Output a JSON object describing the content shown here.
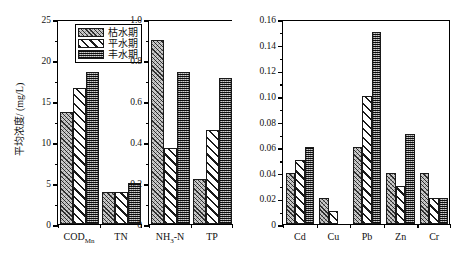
{
  "chart_data": {
    "type": "bar",
    "title": "",
    "xlabel": "",
    "ylabel": "平均浓度/ (mg/L)",
    "grid": false,
    "legend_position": "top-left of panel 1",
    "series_names": [
      "枯水期",
      "平水期",
      "丰水期"
    ],
    "panels": [
      {
        "name": "panel-nutrients-1",
        "categories": [
          "CODMn",
          "TN"
        ],
        "category_labels": [
          "COD<sub>Mn</sub>",
          "TN"
        ],
        "ylim": [
          0,
          25
        ],
        "yticks": [
          0,
          5,
          10,
          15,
          20,
          25
        ],
        "ytick_labels": [
          "0",
          "5",
          "10",
          "15",
          "20",
          "25"
        ],
        "yminor_step": 2.5,
        "series": [
          {
            "name": "枯水期",
            "values": [
              13.7,
              3.9
            ]
          },
          {
            "name": "平水期",
            "values": [
              16.6,
              3.9
            ]
          },
          {
            "name": "丰水期",
            "values": [
              18.5,
              5.0
            ]
          }
        ]
      },
      {
        "name": "panel-nutrients-2",
        "categories": [
          "NH3-N",
          "TP"
        ],
        "category_labels": [
          "NH<sub>3</sub>-N",
          "TP"
        ],
        "ylim": [
          0,
          1.0
        ],
        "yticks": [
          0,
          0.2,
          0.4,
          0.6,
          0.8,
          1.0
        ],
        "ytick_labels": [
          "0",
          "0.2",
          "0.4",
          "0.6",
          "0.8",
          "1.0"
        ],
        "yminor_step": 0.1,
        "series": [
          {
            "name": "枯水期",
            "values": [
              0.9,
              0.22
            ]
          },
          {
            "name": "平水期",
            "values": [
              0.37,
              0.46
            ]
          },
          {
            "name": "丰水期",
            "values": [
              0.74,
              0.71
            ]
          }
        ]
      },
      {
        "name": "panel-metals",
        "categories": [
          "Cd",
          "Cu",
          "Pb",
          "Zn",
          "Cr"
        ],
        "category_labels": [
          "Cd",
          "Cu",
          "Pb",
          "Zn",
          "Cr"
        ],
        "ylim": [
          0,
          0.16
        ],
        "yticks": [
          0,
          0.02,
          0.04,
          0.06,
          0.08,
          0.1,
          0.12,
          0.14,
          0.16
        ],
        "ytick_labels": [
          "0",
          "0.02",
          "0.04",
          "0.06",
          "0.08",
          "0.10",
          "0.12",
          "0.14",
          "0.16"
        ],
        "yminor_step": 0.01,
        "series": [
          {
            "name": "枯水期",
            "values": [
              0.04,
              0.02,
              0.06,
              0.04,
              0.04
            ]
          },
          {
            "name": "平水期",
            "values": [
              0.05,
              0.01,
              0.1,
              0.03,
              0.02
            ]
          },
          {
            "name": "丰水期",
            "values": [
              0.06,
              0.0,
              0.15,
              0.07,
              0.02
            ]
          }
        ]
      }
    ]
  },
  "legend": {
    "items": [
      {
        "label": "枯水期",
        "pattern": "fine-hatch-light"
      },
      {
        "label": "平水期",
        "pattern": "wide-diagonal-stripes"
      },
      {
        "label": "丰水期",
        "pattern": "dense-dark-stipple"
      }
    ]
  },
  "colors": {
    "axis": "#000000",
    "background": "#ffffff",
    "series1": "#c9c9c9",
    "series2": "#ffffff",
    "series3": "#6f6f6f"
  }
}
